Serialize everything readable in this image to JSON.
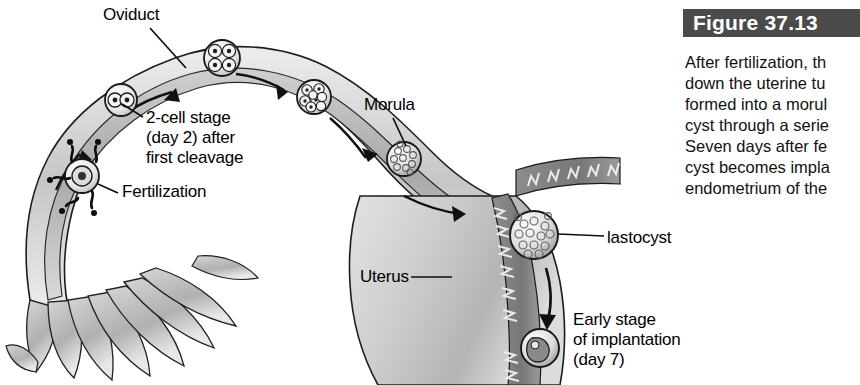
{
  "figure": {
    "number_label": "Figure 37.13",
    "caption_lines": [
      "After fertilization, th",
      "down the uterine tu",
      "formed into a morul",
      "cyst through a serie",
      "Seven days after fe",
      "cyst becomes impla",
      "endometrium of the"
    ],
    "bar_color": "#4a4a4a",
    "bar_text_color": "#ffffff"
  },
  "diagram": {
    "title_alt": "Human fertilization and early embryonic development in the oviduct and uterus",
    "labels": {
      "oviduct": "Oviduct",
      "two_cell": "2-cell stage\n(day 2) after\nfirst cleavage",
      "fertilization": "Fertilization",
      "morula": "Morula",
      "uterus": "Uterus",
      "blastocyst": "lastocyst",
      "early_implantation": "Early stage\nof implantation\n(day 7)"
    },
    "stages": [
      {
        "name": "fertilization",
        "day": "",
        "cells": 1
      },
      {
        "name": "2-cell stage",
        "day": "day 2",
        "cells": 2
      },
      {
        "name": "4-cell stage",
        "day": "",
        "cells": 4
      },
      {
        "name": "8-cell stage",
        "day": "",
        "cells": 8
      },
      {
        "name": "morula",
        "day": "",
        "cells": 16
      },
      {
        "name": "blastocyst",
        "day": "",
        "cells": 64
      },
      {
        "name": "implantation",
        "day": "day 7",
        "cells": 64
      }
    ],
    "colors": {
      "tissue_light": "#d8d8d8",
      "tissue_mid": "#b5b5b5",
      "tissue_dark": "#8f8f8f",
      "lumen": "#9a9a9a",
      "outline": "#1a1a1a",
      "embryo_fill": "#f2f2f2",
      "background": "#ffffff"
    }
  }
}
